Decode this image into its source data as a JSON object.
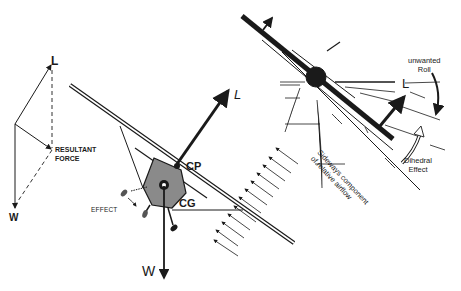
{
  "diagram": {
    "force_triangle": {
      "lift_label": "L",
      "resultant_label_line1": "RESULTANT",
      "resultant_label_line2": "FORCE",
      "weight_label": "W"
    },
    "front_view": {
      "lift_label": "L",
      "center_of_pressure_label": "CP",
      "center_of_gravity_label": "CG",
      "weight_label": "W",
      "effect_label": "EFFECT"
    },
    "rear_view": {
      "lift_label": "L",
      "roll_label_line1": "unwanted",
      "roll_label_line2": "Roll",
      "dihedral_label_line1": "Dihedral",
      "dihedral_label_line2": "Effect",
      "airflow_label_line1": "Sideways component",
      "airflow_label_line2": "of relative airflow"
    },
    "colors": {
      "ink": "#1a1a1a",
      "fuselage": "#8a8a8a",
      "background": "#ffffff"
    }
  }
}
